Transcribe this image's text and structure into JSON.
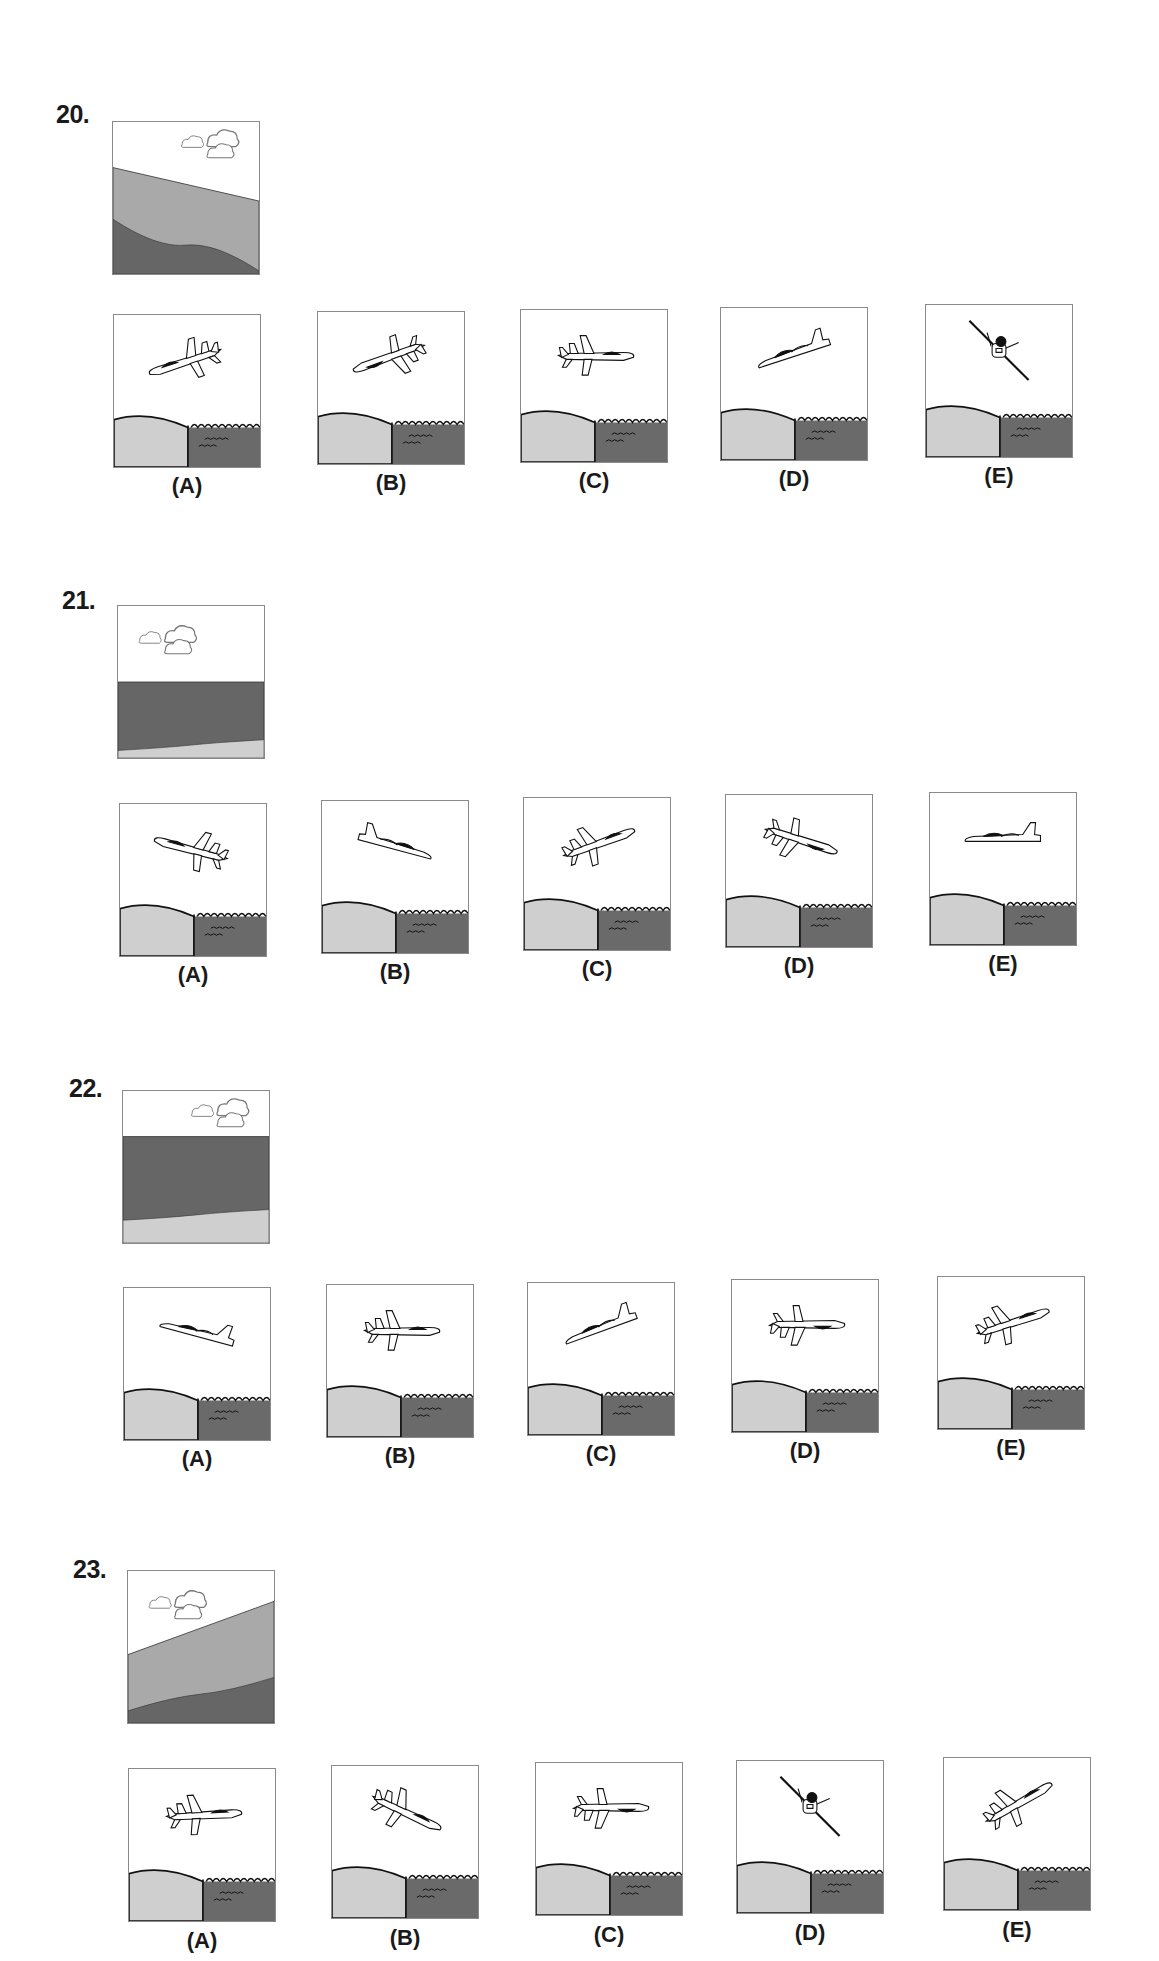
{
  "colors": {
    "sky": "#ffffff",
    "light_ground": "#cfcfcf",
    "mid_ground": "#a9a9a9",
    "dark_ground": "#666666",
    "water": "#6a6a6a",
    "outline": "#1a1a1a",
    "border": "#8a8a8a"
  },
  "questions": [
    {
      "number": "20.",
      "view": {
        "type": "banked",
        "horizon_left": 0.3,
        "horizon_right": 0.52,
        "dark_left": 0.64,
        "dark_right": 0.98,
        "upper_band": "mid",
        "lower_band": "dark"
      },
      "options": [
        {
          "label": "(A)",
          "aircraft": "side-climb-right-banked",
          "pitch": -18,
          "view": "top-side"
        },
        {
          "label": "(B)",
          "aircraft": "underside-climb-right",
          "pitch": -20,
          "view": "bottom"
        },
        {
          "label": "(C)",
          "aircraft": "top-level-left",
          "pitch": 0,
          "view": "top-flip"
        },
        {
          "label": "(D)",
          "aircraft": "side-climb-right",
          "pitch": -18,
          "view": "side"
        },
        {
          "label": "(E)",
          "aircraft": "head-on-banked",
          "pitch": 0,
          "view": "front"
        }
      ]
    },
    {
      "number": "21.",
      "view": {
        "type": "level",
        "horizon_left": 0.5,
        "horizon_right": 0.5,
        "dark_left": 0.95,
        "dark_right": 0.88,
        "upper_band": "dark",
        "lower_band": "light"
      },
      "options": [
        {
          "label": "(A)",
          "aircraft": "top-dive-left",
          "pitch": 15,
          "view": "top"
        },
        {
          "label": "(B)",
          "aircraft": "side-dive-left",
          "pitch": 15,
          "view": "side-flip"
        },
        {
          "label": "(C)",
          "aircraft": "top-climb-right",
          "pitch": -20,
          "view": "top-rev"
        },
        {
          "label": "(D)",
          "aircraft": "bottom-dive-right",
          "pitch": 18,
          "view": "bottom-rev"
        },
        {
          "label": "(E)",
          "aircraft": "side-level-right",
          "pitch": 0,
          "view": "side"
        }
      ]
    },
    {
      "number": "22.",
      "view": {
        "type": "level-nose-down",
        "horizon_left": 0.3,
        "horizon_right": 0.3,
        "dark_left": 0.85,
        "dark_right": 0.78,
        "upper_band": "dark",
        "lower_band": "light"
      },
      "options": [
        {
          "label": "(A)",
          "aircraft": "side-dive-right",
          "pitch": 15,
          "view": "side"
        },
        {
          "label": "(B)",
          "aircraft": "top-level-left",
          "pitch": 0,
          "view": "top-flip"
        },
        {
          "label": "(C)",
          "aircraft": "side-climb-right",
          "pitch": -20,
          "view": "side"
        },
        {
          "label": "(D)",
          "aircraft": "bottom-level-right",
          "pitch": 0,
          "view": "bottom-rev"
        },
        {
          "label": "(E)",
          "aircraft": "top-climb-left",
          "pitch": -18,
          "view": "top-rev"
        }
      ]
    },
    {
      "number": "23.",
      "view": {
        "type": "banked",
        "horizon_left": 0.55,
        "horizon_right": 0.2,
        "dark_left": 0.92,
        "dark_right": 0.7,
        "upper_band": "mid",
        "lower_band": "dark"
      },
      "options": [
        {
          "label": "(A)",
          "aircraft": "top-level-left",
          "pitch": -3,
          "view": "top-rev"
        },
        {
          "label": "(B)",
          "aircraft": "top-dive-right",
          "pitch": 25,
          "view": "top-flip"
        },
        {
          "label": "(C)",
          "aircraft": "bottom-level-right",
          "pitch": 0,
          "view": "bottom-rev"
        },
        {
          "label": "(D)",
          "aircraft": "head-on-banked",
          "pitch": 0,
          "view": "front"
        },
        {
          "label": "(E)",
          "aircraft": "top-climb-left",
          "pitch": -30,
          "view": "top-rev"
        }
      ]
    }
  ]
}
